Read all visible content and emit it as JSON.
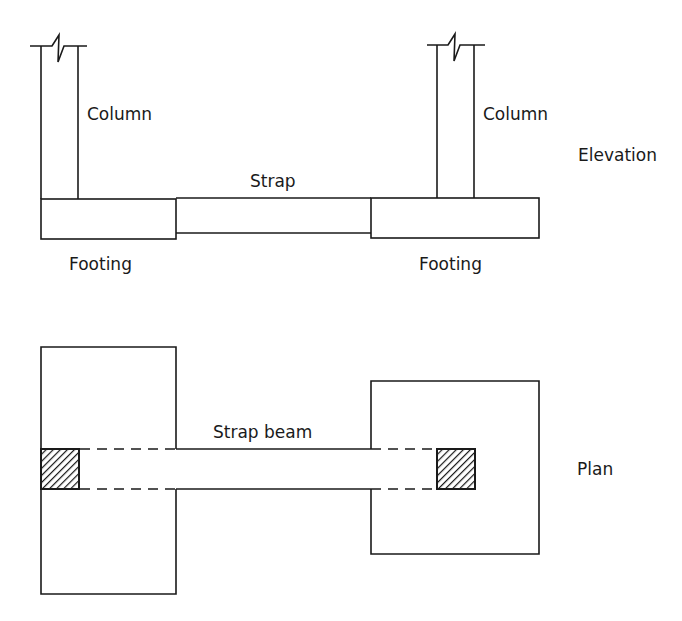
{
  "diagram": {
    "elevation": {
      "view_label": "Elevation",
      "labels": {
        "left_column": "Column",
        "right_column": "Column",
        "strap": "Strap",
        "left_footing": "Footing",
        "right_footing": "Footing"
      }
    },
    "plan": {
      "view_label": "Plan",
      "labels": {
        "strap_beam": "Strap beam"
      },
      "column_hatch": "diagonal-hatch"
    },
    "colors": {
      "line": "#1a1a1a",
      "background": "#ffffff"
    }
  }
}
